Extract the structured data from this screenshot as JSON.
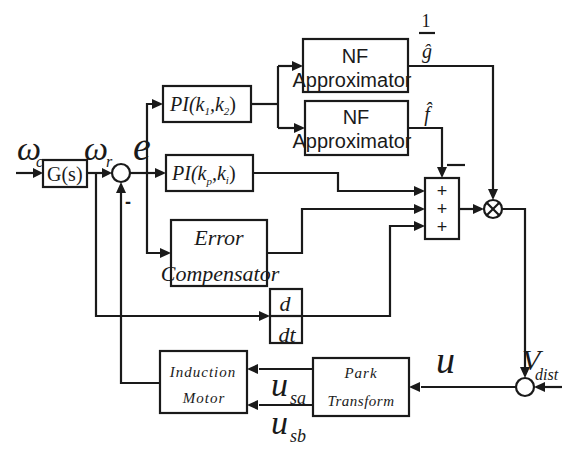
{
  "diagram": {
    "signals": {
      "omega_c": "ω",
      "omega_c_sub": "c",
      "omega_r": "ω",
      "omega_r_sub": "r",
      "error": "e",
      "inv_g_num": "1",
      "inv_g_den": "ĝ",
      "f_hat": "f̂",
      "u": "u",
      "v_dist": "V",
      "v_dist_sub": "dist",
      "u_sa": "u",
      "u_sa_sub": "sa",
      "u_sb": "u",
      "u_sb_sub": "sb",
      "minus_feedback": "-",
      "minus_sum": "—"
    },
    "blocks": {
      "g_s": "G(s)",
      "pi_k1k2_main": "PI(k",
      "pi_k1k2_s1": "1",
      "pi_k1k2_mid": ",k",
      "pi_k1k2_s2": "2",
      "pi_k1k2_end": ")",
      "pi_kpki_main": "PI(k",
      "pi_kpki_s1": "p",
      "pi_kpki_mid": ",k",
      "pi_kpki_s2": "i",
      "pi_kpki_end": ")",
      "nf1_line1": "NF",
      "nf1_line2": "Approximator",
      "nf2_line1": "NF",
      "nf2_line2": "Approximator",
      "err_comp_line1": "Error",
      "err_comp_line2": "Compensator",
      "deriv_num": "d",
      "deriv_den": "dt",
      "induction_line1": "Induction",
      "induction_line2": "Motor",
      "park_line1": "Park",
      "park_line2": "Transform",
      "sum_signs": [
        "+",
        "+",
        "+"
      ],
      "multiplier": "⊗"
    }
  }
}
